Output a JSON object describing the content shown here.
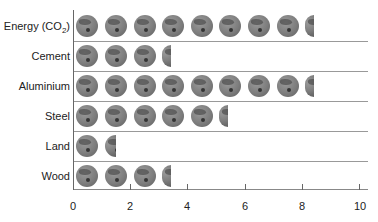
{
  "chart_data": {
    "type": "bar",
    "subtype": "pictogram",
    "title": "",
    "xlabel": "",
    "ylabel": "",
    "categories": [
      "Energy (CO2)",
      "Cement",
      "Aluminium",
      "Steel",
      "Land",
      "Wood"
    ],
    "values": [
      8.4,
      3.4,
      8.4,
      5.4,
      1.5,
      3.4
    ],
    "xlim": [
      0,
      10
    ],
    "xticks": [
      0,
      2,
      4,
      6,
      8,
      10
    ],
    "icon": "globe-icon",
    "grid": false,
    "legend": null
  },
  "labels": {
    "energy_main": "Energy (CO",
    "energy_sub": "2",
    "energy_close": ")",
    "cement": "Cement",
    "aluminium": "Aluminium",
    "steel": "Steel",
    "land": "Land",
    "wood": "Wood"
  },
  "ticks": [
    "0",
    "2",
    "4",
    "6",
    "8",
    "10"
  ]
}
